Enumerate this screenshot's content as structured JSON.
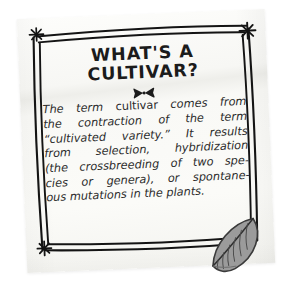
{
  "background_color": "#ffffff",
  "card": {
    "paper_color": "#f8f8f5",
    "rotation_degrees": -2.4,
    "ink_color": "#1b1b1b"
  },
  "ornaments": {
    "star_top_left": "star-asterisk-icon",
    "star_top_right": "star-asterisk-icon",
    "star_bottom_left": "star-asterisk-icon",
    "bowtie": "bowtie-ornament-icon",
    "leaf": "leaf-icon",
    "leaf_fill_color": "#9b9b9b",
    "leaf_outline_color": "#3d3d3d"
  },
  "heading": {
    "line1": "WHAT'S A",
    "line2": "CULTIVAR?"
  },
  "body": {
    "lines": [
      {
        "pre": "The term ",
        "upright": "cultivar",
        "post": " comes from"
      },
      {
        "pre": "the contraction of the term",
        "upright": "",
        "post": ""
      },
      {
        "pre": "“cultivated variety.” It results",
        "upright": "",
        "post": ""
      },
      {
        "pre": "from selection, hybridization",
        "upright": "",
        "post": ""
      },
      {
        "pre": "(the crossbreeding of two spe-",
        "upright": "",
        "post": ""
      },
      {
        "pre": "cies or genera), or spontane-",
        "upright": "",
        "post": ""
      },
      {
        "pre": "ous mutations in the plants.",
        "upright": "",
        "post": ""
      }
    ],
    "full_text": "The term cultivar comes from the contraction of the term “cultivated variety.” It results from selection, hybridization (the crossbreeding of two species or genera), or spontaneous mutations in the plants."
  }
}
